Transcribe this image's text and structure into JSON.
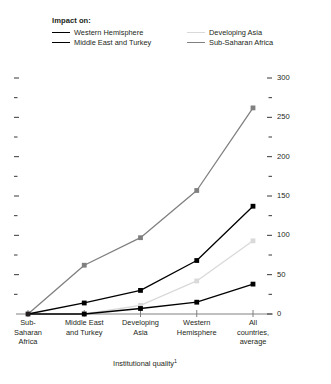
{
  "legend": {
    "title": "Impact on:",
    "entries": [
      {
        "label": "Western Hemisphere",
        "color": "#000000",
        "column": "left"
      },
      {
        "label": "Middle East and Turkey",
        "color": "#000000",
        "column": "left"
      },
      {
        "label": "Developing Asia",
        "color": "#d9d9d9",
        "column": "right"
      },
      {
        "label": "Sub-Saharan Africa",
        "color": "#808080",
        "column": "right"
      }
    ]
  },
  "chart_data": {
    "type": "line",
    "title": "",
    "xlabel": "Institutional quality",
    "xlabel_footnote": "1",
    "ylabel": "Percent change in real GDP per capita",
    "categories": [
      "Sub-Saharan Africa",
      "Middle East and Turkey",
      "Developing Asia",
      "Western Hemisphere",
      "All countries, average"
    ],
    "category_lines": [
      [
        "Sub-",
        "Saharan",
        "Africa"
      ],
      [
        "Middle East",
        "and Turkey"
      ],
      [
        "Developing",
        "Asia"
      ],
      [
        "Western",
        "Hemisphere"
      ],
      [
        "All",
        "countries,",
        "average"
      ]
    ],
    "ylim": [
      0,
      300
    ],
    "yticks": [
      0,
      50,
      100,
      150,
      200,
      250,
      300
    ],
    "ytick_labels": [
      "0",
      "50",
      "100",
      "150",
      "200",
      "250",
      "300"
    ],
    "yminor_ticks": [
      25,
      75,
      125,
      175,
      225,
      275
    ],
    "grid": false,
    "legend_position": "top",
    "series": [
      {
        "name": "Sub-Saharan Africa",
        "color": "#808080",
        "marker": "square",
        "values": [
          0,
          62,
          97,
          157,
          262
        ]
      },
      {
        "name": "Western Hemisphere",
        "color": "#000000",
        "marker": "square",
        "values": [
          0,
          14,
          30,
          68,
          137
        ]
      },
      {
        "name": "Developing Asia",
        "color": "#d9d9d9",
        "marker": "square",
        "values": [
          0,
          0,
          11,
          42,
          93
        ]
      },
      {
        "name": "Middle East and Turkey",
        "color": "#000000",
        "marker": "square",
        "values": [
          0,
          0,
          7,
          15,
          38
        ]
      }
    ]
  }
}
